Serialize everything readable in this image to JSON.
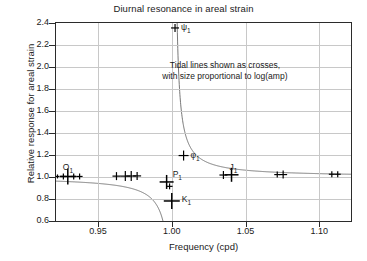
{
  "chart_data": {
    "type": "scatter",
    "title": "Diurnal resonance in areal strain",
    "xlabel": "Frequency (cpd)",
    "ylabel": "Relative response for areal strain",
    "xlim": [
      0.9215,
      1.1215
    ],
    "ylim": [
      0.6,
      2.4
    ],
    "grid": true,
    "xticks": [
      "0.95",
      "1.00",
      "1.05",
      "1.10"
    ],
    "xtick_values": [
      0.95,
      1.0,
      1.05,
      1.1
    ],
    "yticks": [
      "0.6",
      "0.8",
      "1.0",
      "1.2",
      "1.4",
      "1.6",
      "1.8",
      "2.0",
      "2.2",
      "2.4"
    ],
    "ytick_values": [
      0.6,
      0.8,
      1.0,
      1.2,
      1.4,
      1.6,
      1.8,
      2.0,
      2.2,
      2.4
    ],
    "annotations": [
      {
        "name": "crosses-note",
        "line1": "Tidal lines shown as crosses,",
        "line2": "with size proportional to log(amp)",
        "x": 1.036,
        "y": 2.06
      }
    ],
    "marker_style": "cross",
    "marker_note": "size proportional to log(amp)",
    "series": [
      {
        "name": "tidal lines",
        "points": [
          {
            "x": 0.9225,
            "y": 1.005,
            "size": 2
          },
          {
            "x": 0.9265,
            "y": 1.005,
            "size": 3
          },
          {
            "x": 0.9295,
            "y": 1.005,
            "size": 8,
            "label": "O₁",
            "label_text": "O",
            "label_sub": "1"
          },
          {
            "x": 0.9335,
            "y": 1.005,
            "size": 3
          },
          {
            "x": 0.9375,
            "y": 1.005,
            "size": 3
          },
          {
            "x": 0.9625,
            "y": 1.008,
            "size": 4
          },
          {
            "x": 0.9685,
            "y": 1.008,
            "size": 5
          },
          {
            "x": 0.9725,
            "y": 1.009,
            "size": 5
          },
          {
            "x": 0.9765,
            "y": 1.01,
            "size": 4
          },
          {
            "x": 0.9965,
            "y": 0.955,
            "size": 7,
            "label": "P₁",
            "label_text": "P",
            "label_sub": "1"
          },
          {
            "x": 0.9985,
            "y": 0.915,
            "size": 3
          },
          {
            "x": 1.0,
            "y": 0.782,
            "size": 8,
            "label": "K₁",
            "label_text": "K",
            "label_sub": "1"
          },
          {
            "x": 1.0022,
            "y": 2.355,
            "size": 4,
            "label": "ψ₁",
            "label_text": "ψ",
            "label_sub": "1"
          },
          {
            "x": 1.008,
            "y": 1.195,
            "size": 5,
            "label": "φ₁",
            "label_text": "φ",
            "label_sub": "1"
          },
          {
            "x": 1.035,
            "y": 1.018,
            "size": 4
          },
          {
            "x": 1.0405,
            "y": 1.02,
            "size": 7,
            "label": "J₁",
            "label_text": "J",
            "label_sub": "1"
          },
          {
            "x": 1.0715,
            "y": 1.022,
            "size": 3
          },
          {
            "x": 1.0755,
            "y": 1.022,
            "size": 4
          },
          {
            "x": 1.1085,
            "y": 1.025,
            "size": 3
          },
          {
            "x": 1.1125,
            "y": 1.025,
            "size": 3
          }
        ]
      },
      {
        "name": "resonance curve",
        "type": "line",
        "resonance_frequency": 1.0015,
        "description": "response curve rising to pole near 1.0015 cpd"
      }
    ]
  }
}
